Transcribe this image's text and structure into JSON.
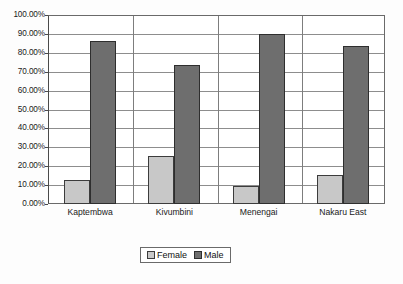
{
  "chart_data": {
    "type": "bar",
    "title": "",
    "xlabel": "",
    "ylabel": "",
    "categories": [
      "Kaptembwa",
      "Kivumbini",
      "Menengai",
      "Nakaru East"
    ],
    "series": [
      {
        "name": "Female",
        "color": "#c8c8c8",
        "values": [
          12.7,
          25.5,
          9.7,
          15.3
        ]
      },
      {
        "name": "Male",
        "color": "#6e6e6e",
        "values": [
          86.0,
          73.5,
          90.0,
          83.5
        ]
      }
    ],
    "ylim": [
      0,
      100
    ],
    "ytick_values": [
      0,
      10,
      20,
      30,
      40,
      50,
      60,
      70,
      80,
      90,
      100
    ],
    "ytick_labels": [
      "0.00%",
      "10.00%",
      "20.00%",
      "30.00%",
      "40.00%",
      "50.00%",
      "60.00%",
      "70.00%",
      "80.00%",
      "90.00%",
      "100.00%"
    ],
    "grid": true,
    "legend_position": "bottom",
    "legend_entries": [
      "Female",
      "Male"
    ]
  }
}
